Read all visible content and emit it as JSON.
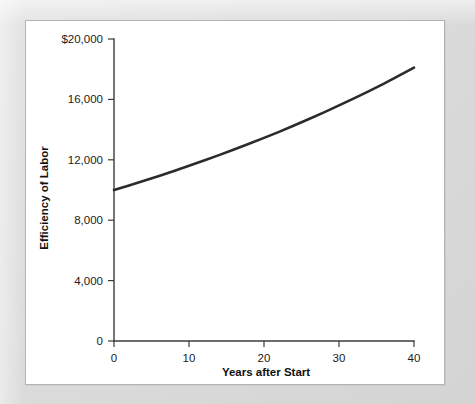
{
  "figure": {
    "frame_color": "#dcdcdc",
    "plate_color": "#ffffff",
    "plate_border_color": "#b4b4b4"
  },
  "chart_data": {
    "type": "line",
    "title": "",
    "subtitle": "",
    "xlabel": "Years after Start",
    "ylabel": "Efficiency of Labor",
    "xlim": [
      0,
      40
    ],
    "ylim": [
      0,
      20000
    ],
    "grid": false,
    "legend": false,
    "legend_position": "none",
    "line_color": "#2b2b2b",
    "x_tick_labels": [
      "0",
      "10",
      "20",
      "30",
      "40"
    ],
    "x_tick_values": [
      0,
      10,
      20,
      30,
      40
    ],
    "y_tick_labels": [
      "0",
      "4,000",
      "8,000",
      "12,000",
      "16,000",
      "$20,000"
    ],
    "y_tick_values": [
      0,
      4000,
      8000,
      12000,
      16000,
      20000
    ],
    "series": [
      {
        "name": "Efficiency of Labor",
        "x": [
          0,
          2,
          4,
          6,
          8,
          10,
          12,
          14,
          16,
          18,
          20,
          22,
          24,
          26,
          28,
          30,
          32,
          34,
          36,
          38,
          40
        ],
        "values": [
          10000,
          10300,
          10610,
          10930,
          11260,
          11600,
          11950,
          12310,
          12680,
          13060,
          13450,
          13850,
          14270,
          14700,
          15140,
          15600,
          16070,
          16550,
          17050,
          17570,
          18100
        ]
      }
    ],
    "annotations": []
  }
}
